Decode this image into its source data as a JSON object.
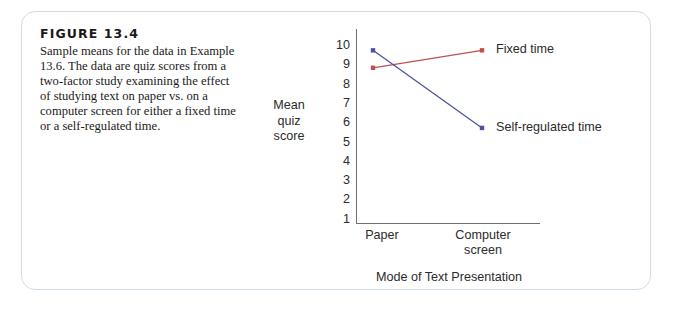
{
  "figure": {
    "number_label": "FIGURE 13.4",
    "caption": "Sample means for the data in Example 13.6. The data are quiz scores from a two-factor study examining the effect of studying text on paper vs. on a computer screen for either a fixed time or a self-regulated time."
  },
  "colors": {
    "series_fixed_time": "#c0504d",
    "series_self_regulated": "#4a50a0",
    "axis": "#6f6f6f",
    "frame_border": "#cfdde6",
    "text": "#2b2b2b"
  },
  "chart_data": {
    "type": "line",
    "title": "",
    "categories": [
      "Paper",
      "Computer screen"
    ],
    "xlabel": "Mode of Text Presentation",
    "ylabel": "Mean quiz score",
    "ylim": [
      0,
      10
    ],
    "yticks": [
      10,
      9,
      8,
      7,
      6,
      5,
      4,
      3,
      2,
      1
    ],
    "grid": false,
    "legend_position": "right-inline",
    "series": [
      {
        "name": "Fixed time",
        "color": "#c0504d",
        "values": [
          8.0,
          8.9
        ]
      },
      {
        "name": "Self-regulated time",
        "color": "#4a50a0",
        "values": [
          8.9,
          4.9
        ]
      }
    ]
  }
}
